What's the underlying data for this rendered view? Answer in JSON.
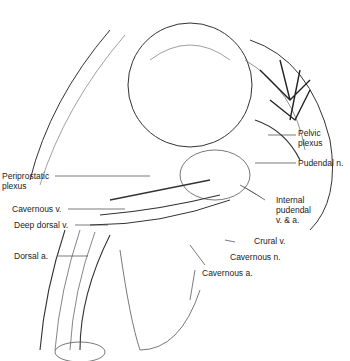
{
  "figure": {
    "labels": {
      "pelvic_plexus": "Pelvic\nplexus",
      "pudendal_n": "Pudendal n.",
      "periprostatic_plexus": "Periprostatic\nplexus",
      "internal_pudendal": "Internal\npudendal\nv. & a.",
      "cavernous_v": "Cavernous v.",
      "deep_dorsal_v": "Deep dorsal v.",
      "crural_v": "Crural v.",
      "dorsal_a": "Dorsal a.",
      "cavernous_n": "Cavernous n.",
      "cavernous_a": "Cavernous a."
    }
  }
}
